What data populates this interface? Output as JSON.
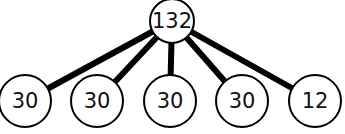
{
  "tree": {
    "root": {
      "label": "132",
      "cx": 172,
      "cy": 21,
      "r": 22
    },
    "children": [
      {
        "label": "30",
        "cx": 25,
        "cy": 101,
        "r": 26
      },
      {
        "label": "30",
        "cx": 97,
        "cy": 101,
        "r": 26
      },
      {
        "label": "30",
        "cx": 170,
        "cy": 101,
        "r": 26
      },
      {
        "label": "30",
        "cx": 242,
        "cy": 101,
        "r": 26
      },
      {
        "label": "12",
        "cx": 315,
        "cy": 101,
        "r": 26
      }
    ]
  }
}
